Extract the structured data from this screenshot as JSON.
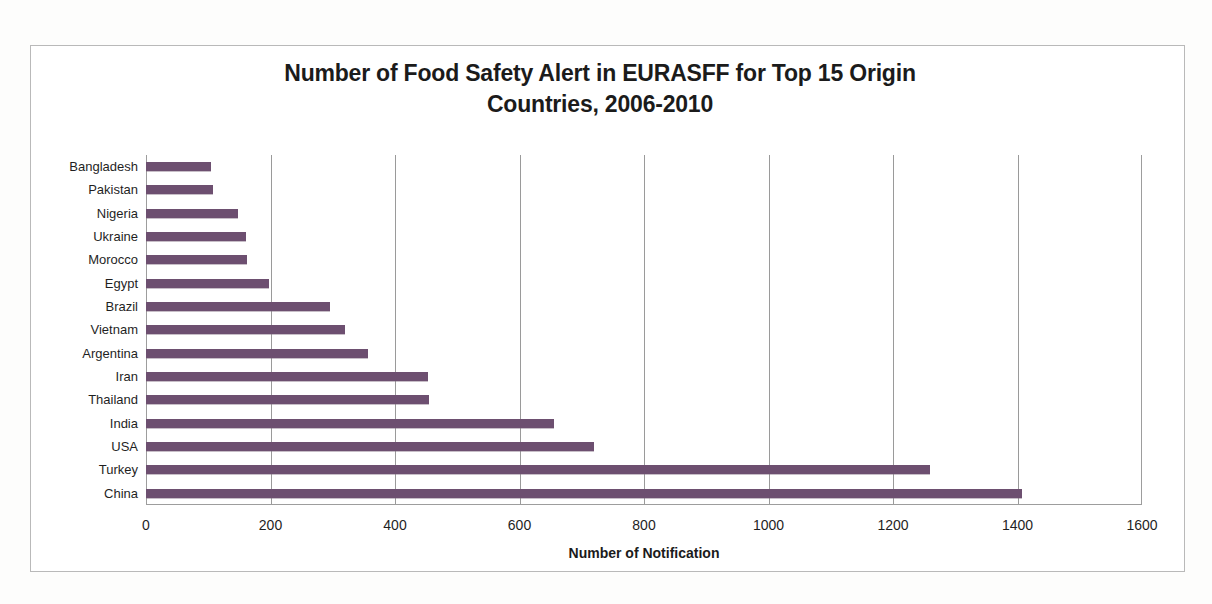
{
  "chart_data": {
    "type": "bar",
    "orientation": "horizontal",
    "title": "Number of Food Safety Alert in EURASFF for Top 15 Origin Countries, 2006-2010",
    "title_lines": [
      "Number of Food Safety Alert in EURASFF for Top 15 Origin",
      "Countries, 2006-2010"
    ],
    "xlabel": "Number of Notification",
    "ylabel": "",
    "categories": [
      "Bangladesh",
      "Pakistan",
      "Nigeria",
      "Ukraine",
      "Morocco",
      "Egypt",
      "Brazil",
      "Vietnam",
      "Argentina",
      "Iran",
      "Thailand",
      "India",
      "USA",
      "Turkey",
      "China"
    ],
    "values": [
      105,
      108,
      148,
      160,
      162,
      197,
      295,
      320,
      357,
      453,
      455,
      655,
      720,
      1260,
      1408
    ],
    "series": [
      {
        "name": "Number of Notification",
        "values": [
          105,
          108,
          148,
          160,
          162,
          197,
          295,
          320,
          357,
          453,
          455,
          655,
          720,
          1260,
          1408
        ]
      }
    ],
    "xticks": [
      0,
      200,
      400,
      600,
      800,
      1000,
      1200,
      1400,
      1600
    ],
    "xtick_labels": [
      "0",
      "200",
      "400",
      "600",
      "800",
      "1000",
      "1200",
      "1400",
      "1600"
    ],
    "xlim": [
      0,
      1600
    ],
    "grid": "vertical-only",
    "legend": "none",
    "bar_color": "#6d4f70",
    "gridline_color": "#9a9a9a",
    "frame_color": "#b9b9b9",
    "background_color": "#ffffff"
  }
}
